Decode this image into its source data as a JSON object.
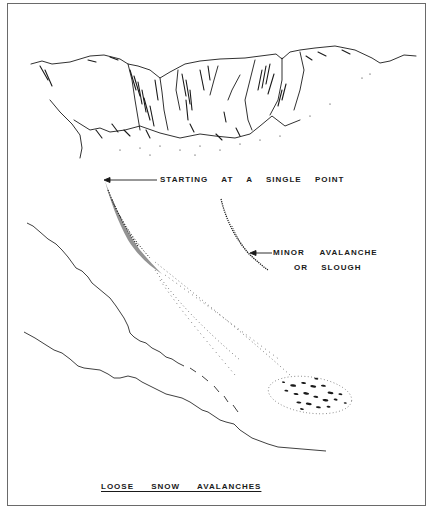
{
  "diagram": {
    "title": "LOOSE SNOW AVALANCHES",
    "labels": {
      "starting_point": "STARTING AT A SINGLE POINT",
      "minor_line1": "MINOR AVALANCHE",
      "minor_line2": "OR SLOUGH"
    },
    "elements": [
      {
        "id": "mountain-ridge",
        "description": "Rocky cliff ridge drawn in pen at top"
      },
      {
        "id": "main-avalanche-path",
        "description": "Stippled path fanning out downslope from a single point"
      },
      {
        "id": "minor-slough-path",
        "description": "Short narrow stippled path"
      },
      {
        "id": "debris-deposit",
        "description": "Dense stippled debris at bottom of path"
      },
      {
        "id": "slope-lines",
        "description": "Two wavy lines depicting terrain slope"
      }
    ],
    "colors": {
      "ink": "#1a1a1a",
      "frame": "#6a6a6a",
      "paper": "#ffffff"
    }
  }
}
